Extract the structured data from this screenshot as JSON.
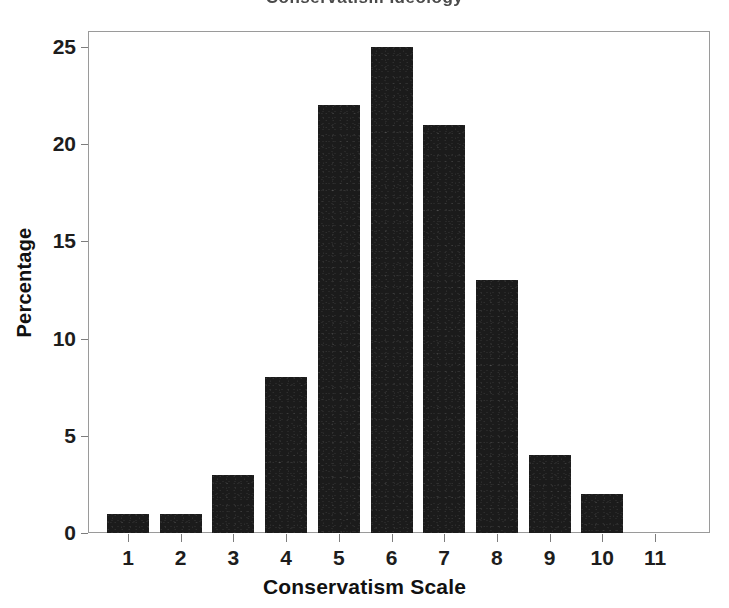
{
  "chart_data": {
    "type": "bar",
    "title": "",
    "title_remnant": "Conservatism Ideology",
    "xlabel": "Conservatism Scale",
    "ylabel": "Percentage",
    "categories": [
      "1",
      "2",
      "3",
      "4",
      "5",
      "6",
      "7",
      "8",
      "9",
      "10",
      "11"
    ],
    "values": [
      1,
      1,
      3,
      8,
      22,
      25,
      21,
      13,
      4,
      2,
      0
    ],
    "ylim": [
      0,
      26
    ],
    "yticks": [
      0,
      5,
      10,
      15,
      20,
      25
    ],
    "ytick_labels": [
      "0",
      "5",
      "10",
      "15",
      "20",
      "25"
    ],
    "xticks": [
      1,
      2,
      3,
      4,
      5,
      6,
      7,
      8,
      9,
      10,
      11
    ],
    "xtick_labels": [
      "1",
      "2",
      "3",
      "4",
      "5",
      "6",
      "7",
      "8",
      "9",
      "10",
      "11"
    ],
    "grid": false,
    "legend": null,
    "bar_color": "#1b1b1b",
    "frame_color": "#9a9a9a",
    "background_color": "#ffffff"
  }
}
